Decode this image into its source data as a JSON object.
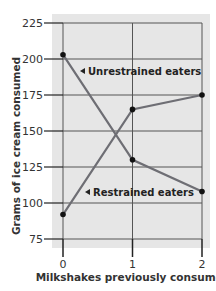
{
  "chart_data": {
    "type": "line",
    "title": "",
    "xlabel": "Milkshakes previously consumed",
    "ylabel": "Grams of ice cream consumed",
    "x": [
      0,
      1,
      2
    ],
    "x_tick_labels": [
      "0",
      "1",
      "2"
    ],
    "y_ticks": [
      75,
      100,
      125,
      150,
      175,
      200,
      225
    ],
    "ylim": [
      75,
      225
    ],
    "xlim": [
      0,
      2
    ],
    "grid": true,
    "series": [
      {
        "name": "Unrestrained eaters",
        "values": [
          203,
          130,
          108
        ],
        "label_position": "upper-left"
      },
      {
        "name": "Restrained eaters",
        "values": [
          92,
          165,
          175
        ],
        "label_position": "lower-middle"
      }
    ],
    "colors": {
      "line": "#6e6e74",
      "marker": "#111111",
      "grid": "#555555",
      "plot_background": "#e6e6e6"
    }
  },
  "labels": {
    "unrestrained": "Unrestrained eaters",
    "restrained": "Restrained eaters",
    "xlabel": "Milkshakes previously consumed",
    "ylabel": "Grams of ice cream consumed"
  }
}
